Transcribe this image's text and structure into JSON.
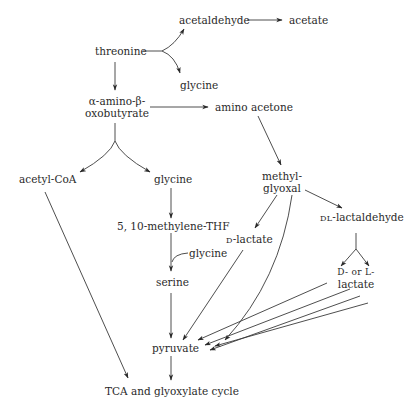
{
  "diagram": {
    "type": "metabolic-pathway",
    "nodes": {
      "threonine": "threonine",
      "acetaldehyde": "acetaldehyde",
      "acetate": "acetate",
      "glycine_top": "glycine",
      "amino_oxobutyrate_line1": "α-amino-β-",
      "amino_oxobutyrate_line2": "oxobutyrate",
      "amino_acetone": "amino acetone",
      "acetyl_coa": "acetyl-CoA",
      "glycine_mid": "glycine",
      "methylene_thf": "5, 10-methylene-THF",
      "glycine_side": "glycine",
      "serine": "serine",
      "methylglyoxal_line1": "methyl-",
      "methylglyoxal_line2": "glyoxal",
      "d_lactate_prefix": "D",
      "d_lactate_suffix": "-lactate",
      "dl_lactaldehyde_prefix": "DL",
      "dl_lactaldehyde_suffix": "-lactaldehyde",
      "dl_lactate_line1": "D-  or  L-",
      "dl_lactate_line2": "lactate",
      "pyruvate": "pyruvate",
      "tca": "TCA and glyoxylate cycle"
    },
    "edges": [
      {
        "from": "threonine",
        "to": "acetaldehyde"
      },
      {
        "from": "threonine",
        "to": "glycine"
      },
      {
        "from": "acetaldehyde",
        "to": "acetate"
      },
      {
        "from": "threonine",
        "to": "α-amino-β-oxobutyrate"
      },
      {
        "from": "α-amino-β-oxobutyrate",
        "to": "amino acetone"
      },
      {
        "from": "α-amino-β-oxobutyrate",
        "to": "acetyl-CoA"
      },
      {
        "from": "α-amino-β-oxobutyrate",
        "to": "glycine"
      },
      {
        "from": "glycine",
        "to": "5, 10-methylene-THF"
      },
      {
        "from": "5, 10-methylene-THF",
        "to": "serine",
        "cofactor": "glycine"
      },
      {
        "from": "amino acetone",
        "to": "methylglyoxal"
      },
      {
        "from": "methylglyoxal",
        "to": "D-lactate"
      },
      {
        "from": "methylglyoxal",
        "to": "pyruvate"
      },
      {
        "from": "methylglyoxal",
        "to": "DL-lactaldehyde"
      },
      {
        "from": "DL-lactaldehyde",
        "to": "D- or L-lactate"
      },
      {
        "from": "D-lactate",
        "to": "pyruvate"
      },
      {
        "from": "D- or L-lactate",
        "to": "pyruvate"
      },
      {
        "from": "serine",
        "to": "pyruvate"
      },
      {
        "from": "acetyl-CoA",
        "to": "TCA and glyoxylate cycle"
      },
      {
        "from": "pyruvate",
        "to": "TCA and glyoxylate cycle"
      }
    ]
  }
}
